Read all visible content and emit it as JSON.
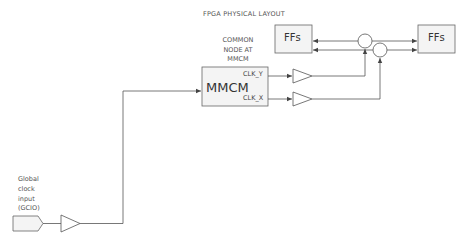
{
  "diagram": {
    "title": "FPGA PHYSICAL LAYOUT",
    "common_node_label": [
      "COMMON",
      "NODE AT",
      "MMCM"
    ],
    "blocks": {
      "ffs_left": "FFs",
      "ffs_right": "FFs",
      "mmcm": "MMCM"
    },
    "ports": {
      "clk_y": "CLK_Y",
      "clk_x": "CLK_X"
    },
    "global_clock_label": [
      "Global",
      "clock",
      "input",
      "(GCIO)"
    ],
    "colors": {
      "stroke": "#555555",
      "fill": "#f2f2f2",
      "text": "#555555"
    }
  }
}
